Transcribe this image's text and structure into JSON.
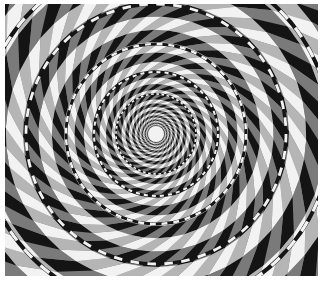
{
  "image": {
    "subject": "Fraser spiral illusion",
    "description": "Concentric circles overlaid on a black, white and grey twisted checkerboard, producing an illusory spiral",
    "colors": {
      "black": "#141414",
      "grey": "#7a7a7a",
      "white": "#f2f2f2",
      "background": "#ffffff"
    },
    "center": {
      "x": 156,
      "y": 134
    },
    "rings": [
      8,
      40,
      62,
      90,
      130,
      175,
      225
    ],
    "spokes": 24
  }
}
